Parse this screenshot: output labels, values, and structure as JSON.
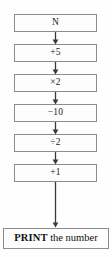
{
  "diagram": {
    "type": "flowchart",
    "orientation": "vertical",
    "colors": {
      "border": "#8d8d8d",
      "background": "#fdfdfd",
      "text": "#1a1a1a",
      "arrow": "#3a3a3a"
    },
    "nodes": [
      {
        "id": "start",
        "label": "N",
        "shape": "rectangle",
        "top": 14
      },
      {
        "id": "step1",
        "label": "+5",
        "shape": "rectangle",
        "top": 44
      },
      {
        "id": "step2",
        "label": "×2",
        "shape": "rectangle",
        "top": 74
      },
      {
        "id": "step3",
        "label": "−10",
        "shape": "rectangle",
        "top": 104
      },
      {
        "id": "step4",
        "label": "÷2",
        "shape": "rectangle",
        "top": 134
      },
      {
        "id": "step5",
        "label": "+1",
        "shape": "rectangle",
        "top": 164
      }
    ],
    "output_node": {
      "id": "print",
      "keyword": "PRINT",
      "rest": " the number",
      "full_label": "PRINT the number",
      "shape": "rectangle",
      "top": 228
    },
    "connectors": [
      {
        "id": "arrow-1",
        "from": "start",
        "to": "step1",
        "top": 32
      },
      {
        "id": "arrow-2",
        "from": "step1",
        "to": "step2",
        "top": 62
      },
      {
        "id": "arrow-3",
        "from": "step2",
        "to": "step3",
        "top": 92
      },
      {
        "id": "arrow-4",
        "from": "step3",
        "to": "step4",
        "top": 122
      },
      {
        "id": "arrow-5",
        "from": "step4",
        "to": "step5",
        "top": 152
      },
      {
        "id": "arrow-6",
        "from": "step5",
        "to": "print",
        "top": 182
      }
    ]
  }
}
